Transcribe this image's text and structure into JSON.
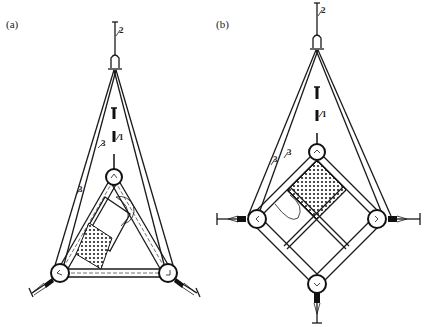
{
  "figure": {
    "panels": [
      {
        "id": "a",
        "label": "(a)",
        "shape": "triangle frame",
        "callouts": {
          "rope": "2",
          "rod": "1",
          "bridles": [
            "3",
            "3"
          ]
        }
      },
      {
        "id": "b",
        "label": "(b)",
        "shape": "diamond frame",
        "callouts": {
          "rope": "2",
          "rod": "1",
          "bridles": [
            "3",
            "3"
          ]
        }
      }
    ],
    "colors": {
      "ink": "#1a1a1a",
      "background": "#ffffff"
    }
  }
}
